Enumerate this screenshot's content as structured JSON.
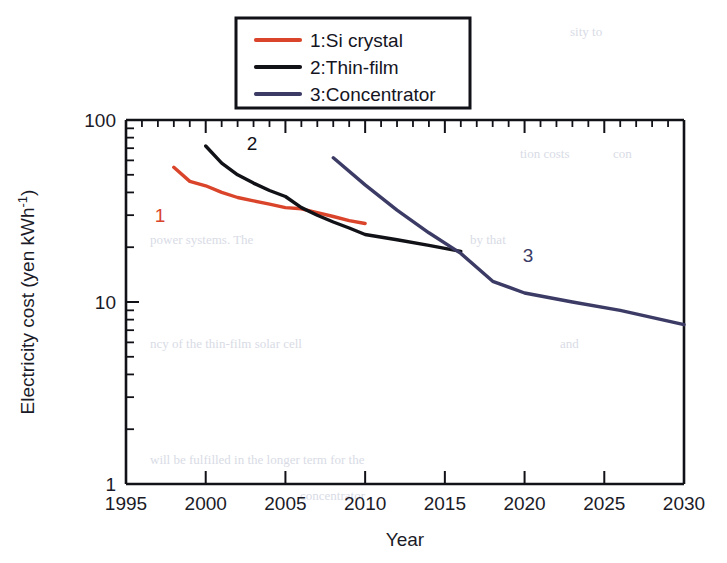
{
  "chart_data": {
    "type": "line",
    "title": "",
    "xlabel": "Year",
    "ylabel": "Electricity cost (yen kWh⁻¹)",
    "xlim": [
      1995,
      2030
    ],
    "ylim": [
      1,
      100
    ],
    "yscale": "log",
    "xscale": "linear",
    "grid": false,
    "xticks": [
      1995,
      2000,
      2005,
      2010,
      2015,
      2020,
      2025,
      2030
    ],
    "xticklabels": [
      "1995",
      "2000",
      "2005",
      "2010",
      "2015",
      "2020",
      "2025",
      "2030"
    ],
    "yticks": [
      1,
      10,
      100
    ],
    "yticklabels": [
      "1",
      "10",
      "100"
    ],
    "legend_position": "top-center-outside",
    "series": [
      {
        "name": "1:Si crystal",
        "label": "1",
        "color": "#d9442a",
        "x": [
          1998.0,
          1999.0,
          2000.0,
          2001.0,
          2002.0,
          2003.0,
          2004.0,
          2005.0,
          2006.0,
          2007.0,
          2008.0,
          2009.0,
          2010.0
        ],
        "y": [
          55.0,
          46.0,
          43.5,
          40.0,
          37.5,
          36.0,
          34.5,
          33.0,
          32.5,
          31.0,
          29.5,
          28.0,
          27.0
        ]
      },
      {
        "name": "2:Thin-film",
        "label": "2",
        "color": "#111118",
        "x": [
          2000.0,
          2001.0,
          2002.0,
          2003.0,
          2004.0,
          2005.0,
          2006.0,
          2007.0,
          2008.0,
          2009.0,
          2010.0,
          2012.0,
          2014.0,
          2016.0
        ],
        "y": [
          72.0,
          58.0,
          50.0,
          45.0,
          41.0,
          38.0,
          33.0,
          30.0,
          27.5,
          25.5,
          23.5,
          22.0,
          20.5,
          19.0
        ]
      },
      {
        "name": "3:Concentrator",
        "label": "3",
        "color": "#3b3b66",
        "x": [
          2008.0,
          2010.0,
          2012.0,
          2014.0,
          2016.0,
          2018.0,
          2020.0,
          2023.0,
          2026.0,
          2030.0
        ],
        "y": [
          62.0,
          44.0,
          32.0,
          24.0,
          18.5,
          13.0,
          11.2,
          10.0,
          9.0,
          7.5
        ]
      }
    ]
  },
  "legend": {
    "entries": [
      {
        "label": "1:Si crystal",
        "color": "#d9442a"
      },
      {
        "label": "2:Thin-film",
        "color": "#111118"
      },
      {
        "label": "3:Concentrator",
        "color": "#3b3b66"
      }
    ]
  },
  "background_text": [
    {
      "text": "n in using a",
      "x": 372,
      "y": 36
    },
    {
      "text": "sity to",
      "x": 570,
      "y": 36
    },
    {
      "text": "tion costs",
      "x": 520,
      "y": 158
    },
    {
      "text": "con",
      "x": 613,
      "y": 158
    },
    {
      "text": "power systems. The",
      "x": 150,
      "y": 244
    },
    {
      "text": "by that",
      "x": 470,
      "y": 244
    },
    {
      "text": "ncy of the thin-film solar cell",
      "x": 150,
      "y": 348
    },
    {
      "text": "and",
      "x": 560,
      "y": 348
    },
    {
      "text": "will be fulfilled in the longer term for the",
      "x": 150,
      "y": 464
    },
    {
      "text": "concentrator",
      "x": 300,
      "y": 500
    }
  ]
}
